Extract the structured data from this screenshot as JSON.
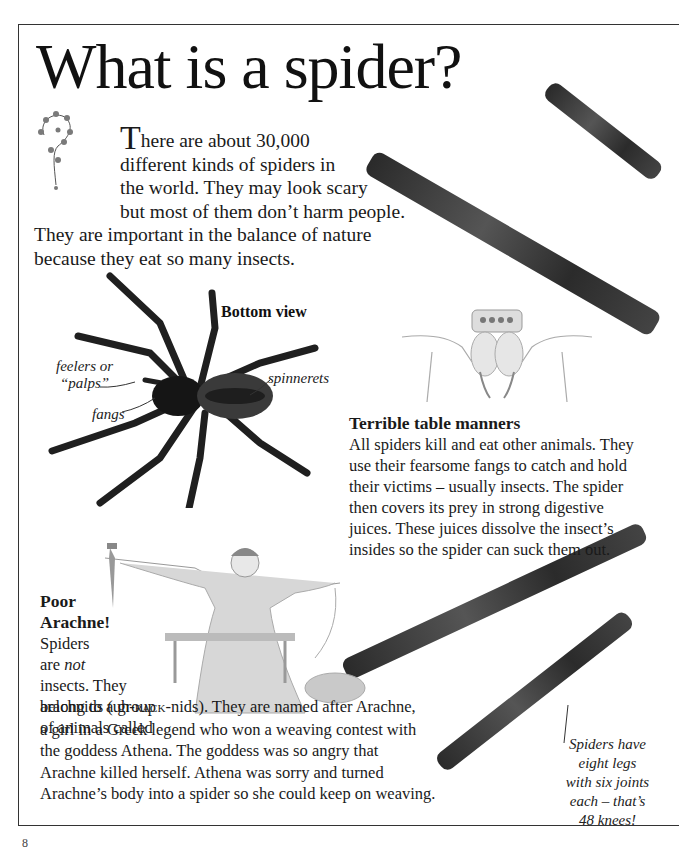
{
  "page": {
    "title": "What is a spider?",
    "page_number": "8"
  },
  "intro": {
    "drop_cap": "T",
    "lines": [
      "here are about 30,000",
      "different kinds of spiders in",
      "the world. They may look scary",
      "but most of them don’t harm people.",
      "They are important in the balance of nature",
      "because they eat so many insects."
    ]
  },
  "spider_diagram": {
    "heading": "Bottom view",
    "labels": {
      "feelers": "feelers or",
      "palps": "“palps”",
      "fangs": "fangs",
      "spinnerets": "spinnerets"
    }
  },
  "table_manners": {
    "heading": "Terrible table manners",
    "lines": [
      "All spiders kill and eat other animals. They",
      "use their fearsome fangs to catch and hold",
      "their victims – usually insects. The spider",
      "then covers its prey in strong digestive",
      "juices. These juices dissolve the insect’s",
      "insides so the spider can suck them out."
    ]
  },
  "arachne": {
    "heading_line1": "Poor",
    "heading_line2": "Arachne!",
    "narrow_lines": [
      "Spiders",
      "are ",
      "insects. They",
      "belong to a group",
      "of animals called"
    ],
    "emphasis": "not",
    "pronunciation_prefix": "arachnids (uh-",
    "pronunciation_caps": "rack",
    "pronunciation_suffix": "-nids). They are named after Arachne,",
    "wide_lines": [
      "a girl in a Greek legend who won a weaving contest with",
      "the goddess Athena. The goddess was so angry that",
      "Arachne killed herself. Athena was sorry and turned",
      "Arachne’s body into a spider so she could keep on weaving."
    ]
  },
  "leg_caption": {
    "lines": [
      "Spiders have",
      "eight legs",
      "with six joints",
      "each – that’s",
      "48 knees!"
    ]
  }
}
